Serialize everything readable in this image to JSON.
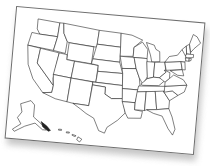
{
  "map": {
    "title": "",
    "subject": "United States outline map",
    "style": "blank state outlines on tilted paper card",
    "colors": {
      "background": "#ffffff",
      "card": "#ffffff",
      "border": "#6e6e6e",
      "outline": "#222222",
      "shadow": "#b9b9b9"
    },
    "regions": [
      "contiguous-us",
      "alaska",
      "hawaii"
    ],
    "rotation_deg": 5
  }
}
